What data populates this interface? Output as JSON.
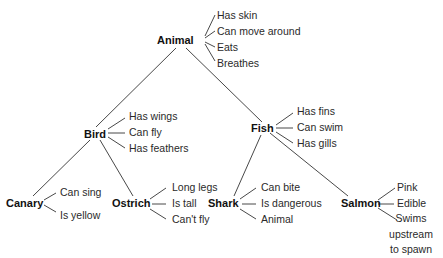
{
  "diagram": {
    "type": "semantic-network-hierarchy",
    "nodes": {
      "animal": {
        "label": "Animal",
        "properties": [
          "Has skin",
          "Can move around",
          "Eats",
          "Breathes"
        ]
      },
      "bird": {
        "label": "Bird",
        "properties": [
          "Has wings",
          "Can fly",
          "Has feathers"
        ]
      },
      "fish": {
        "label": "Fish",
        "properties": [
          "Has fins",
          "Can swim",
          "Has gills"
        ]
      },
      "canary": {
        "label": "Canary",
        "properties": [
          "Can sing",
          "Is yellow"
        ]
      },
      "ostrich": {
        "label": "Ostrich",
        "properties": [
          "Long legs",
          "Is tall",
          "Can't fly"
        ]
      },
      "shark": {
        "label": "Shark",
        "properties": [
          "Can bite",
          "Is dangerous",
          "Animal"
        ]
      },
      "salmon": {
        "label": "Salmon",
        "properties": [
          "Pink",
          "Edible",
          "Swims upstream to spawn"
        ]
      }
    },
    "edges": [
      [
        "Animal",
        "Bird"
      ],
      [
        "Animal",
        "Fish"
      ],
      [
        "Bird",
        "Canary"
      ],
      [
        "Bird",
        "Ostrich"
      ],
      [
        "Fish",
        "Shark"
      ],
      [
        "Fish",
        "Salmon"
      ]
    ]
  }
}
